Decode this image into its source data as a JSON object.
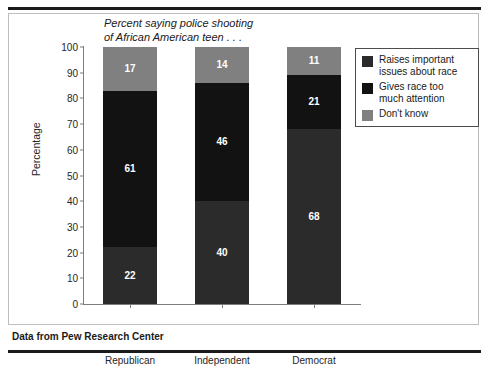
{
  "chart_data": {
    "type": "bar",
    "subtype": "stacked-100-percent",
    "title": "Percent saying police shooting of African American teen . . .",
    "title_lines": [
      "Percent saying police shooting",
      "of African American teen . . ."
    ],
    "xlabel": "",
    "ylabel": "Percentage",
    "categories": [
      "Republican",
      "Independent",
      "Democrat"
    ],
    "series": [
      {
        "name": "Raises important issues about race",
        "values": [
          22,
          40,
          68
        ],
        "color": "#2b2b2b"
      },
      {
        "name": "Gives race too much attention",
        "values": [
          61,
          46,
          21
        ],
        "color": "#121212"
      },
      {
        "name": "Don't know",
        "values": [
          17,
          14,
          11
        ],
        "color": "#808080"
      }
    ],
    "ylim": [
      0,
      100
    ],
    "yticks": [
      0,
      10,
      20,
      30,
      40,
      50,
      60,
      70,
      80,
      90,
      100
    ],
    "ytick_labels": [
      "0",
      "10",
      "20",
      "30",
      "40",
      "50",
      "60",
      "70",
      "80",
      "90",
      "100"
    ],
    "grid": false,
    "legend_position": "right",
    "data_labels": true
  },
  "legend": {
    "items": [
      {
        "label_lines": [
          "Raises important",
          "issues about race"
        ],
        "color": "#2b2b2b"
      },
      {
        "label_lines": [
          "Gives race too",
          "much attention"
        ],
        "color": "#121212"
      },
      {
        "label_lines": [
          "Don't know"
        ],
        "color": "#808080"
      }
    ]
  },
  "source": {
    "text": "Data from Pew Research Center"
  }
}
